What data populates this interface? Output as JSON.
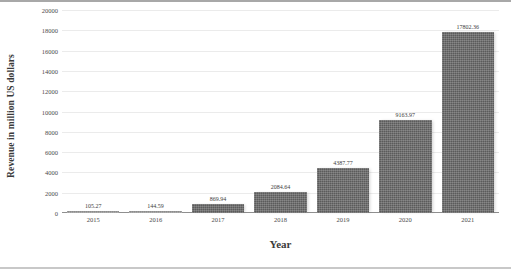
{
  "chart_data": {
    "type": "bar",
    "title": "",
    "xlabel": "Year",
    "ylabel": "Revenue in million US dollars",
    "categories": [
      "2015",
      "2016",
      "2017",
      "2018",
      "2019",
      "2020",
      "2021"
    ],
    "values": [
      105.27,
      144.59,
      869.94,
      2084.64,
      4387.77,
      9163.97,
      17802.36
    ],
    "value_labels": [
      "105.27",
      "144.59",
      "869.94",
      "2084.64",
      "4387.77",
      "9163.97",
      "17802.36"
    ],
    "ylim": [
      0,
      20000
    ],
    "ytick_values": [
      0,
      2000,
      4000,
      6000,
      8000,
      10000,
      12000,
      14000,
      16000,
      18000,
      20000
    ],
    "ytick_labels": [
      "0",
      "2000",
      "4000",
      "6000",
      "8000",
      "10000",
      "12000",
      "14000",
      "16000",
      "18000",
      "20000"
    ],
    "grid": true,
    "legend": false,
    "series": [
      {
        "name": "Revenue",
        "values": [
          105.27,
          144.59,
          869.94,
          2084.64,
          4387.77,
          9163.97,
          17802.36
        ]
      }
    ],
    "colors": {
      "bar_fill": "#5b5b5b",
      "bar_fill_light": "#8d8d8d",
      "gridline": "#ebebeb",
      "axis": "#8f8f8f",
      "text": "#3b3b3b",
      "tick_text": "#4a4a4a",
      "background": "#ffffff"
    }
  }
}
